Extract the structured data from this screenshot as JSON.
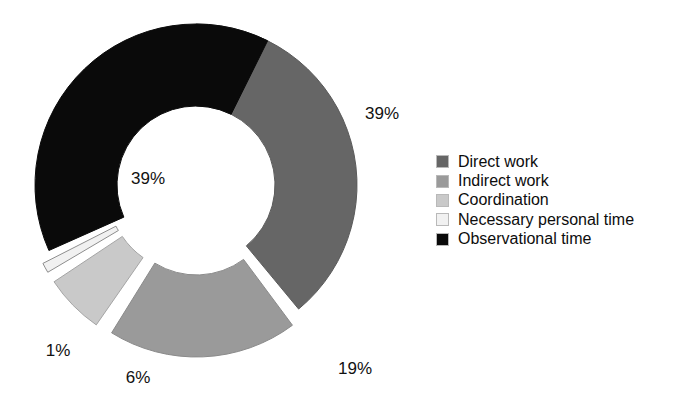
{
  "chart_data": {
    "type": "pie",
    "title": "",
    "subtitle": "",
    "xlabel": "",
    "ylabel": "",
    "donut": true,
    "hole_ratio": 0.49,
    "start_angle_deg": 0,
    "direction": "clockwise",
    "grid": false,
    "legend_position": "right",
    "categories": [
      "Direct work",
      "Indirect work",
      "Coordination",
      "Necessary personal time",
      "Observational time"
    ],
    "values": [
      39,
      19,
      6,
      1,
      39
    ],
    "value_labels": [
      "39%",
      "19%",
      "6%",
      "1%",
      "39%"
    ],
    "colors": [
      "#666666",
      "#9a9a9a",
      "#c9c9c9",
      "#f1f1f1",
      "#0a0a0a"
    ],
    "exploded": [
      false,
      true,
      true,
      true,
      false
    ],
    "series": [
      {
        "name": "Share of time",
        "values": [
          39,
          19,
          6,
          1,
          39
        ]
      }
    ]
  },
  "chart": {
    "slices": [
      {
        "name": "Direct work",
        "label": "39%",
        "color": "#666666",
        "stroke": "#5a5a5a",
        "start": 0,
        "end": 140.4,
        "explode": 0,
        "label_x": 382,
        "label_y": 119
      },
      {
        "name": "Indirect work",
        "label": "19%",
        "color": "#9a9a9a",
        "stroke": "#8a8a8a",
        "start": 143.4,
        "end": 211.8,
        "explode": 11,
        "label_x": 355,
        "label_y": 374
      },
      {
        "name": "Coordination",
        "label": "6%",
        "color": "#c9c9c9",
        "stroke": "#a5a5a5",
        "start": 214.8,
        "end": 236.4,
        "explode": 11,
        "label_x": 138,
        "label_y": 383
      },
      {
        "name": "Necessary personal time",
        "label": "1%",
        "color": "#f1f1f1",
        "stroke": "#8d8d8d",
        "start": 239.4,
        "end": 243.0,
        "explode": 11,
        "label_x": 58,
        "label_y": 356
      },
      {
        "name": "Observational time",
        "label": "39%",
        "color": "#0a0a0a",
        "stroke": "#0a0a0a",
        "start": 246.0,
        "end": 386.4,
        "explode": 0,
        "label_x": 148,
        "label_y": 184
      }
    ]
  },
  "legend": {
    "items": [
      {
        "label": "Direct work",
        "color": "#666666"
      },
      {
        "label": "Indirect work",
        "color": "#9a9a9a"
      },
      {
        "label": "Coordination",
        "color": "#c9c9c9"
      },
      {
        "label": "Necessary personal time",
        "color": "#f1f1f1"
      },
      {
        "label": "Observational time",
        "color": "#0a0a0a"
      }
    ]
  }
}
